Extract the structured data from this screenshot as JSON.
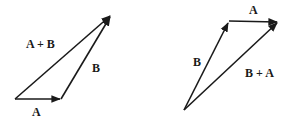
{
  "diagram": {
    "left": {
      "vectors": [
        {
          "name": "A",
          "from": [
            15,
            99
          ],
          "to": [
            61,
            99
          ]
        },
        {
          "name": "B",
          "from": [
            61,
            99
          ],
          "to": [
            111,
            15
          ]
        },
        {
          "name": "A + B",
          "from": [
            15,
            99
          ],
          "to": [
            111,
            15
          ]
        }
      ],
      "labels": {
        "sum": "A + B",
        "b": "B",
        "a": "A"
      }
    },
    "right": {
      "vectors": [
        {
          "name": "B",
          "from": [
            184,
            110
          ],
          "to": [
            229,
            21
          ]
        },
        {
          "name": "A",
          "from": [
            229,
            21
          ],
          "to": [
            278,
            22
          ]
        },
        {
          "name": "B + A",
          "from": [
            184,
            110
          ],
          "to": [
            278,
            22
          ]
        }
      ],
      "labels": {
        "a": "A",
        "b": "B",
        "sum": "B + A"
      }
    },
    "colors": {
      "stroke": "#1a1a1a",
      "background": "#ffffff"
    }
  }
}
